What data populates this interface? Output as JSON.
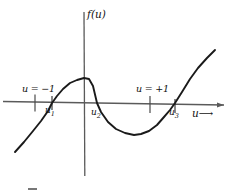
{
  "figure": {
    "kind": "cubic-function-plot",
    "background_color": "#ffffff",
    "ink_color": "#1a1a1a",
    "axis_color": "#555555"
  },
  "axes": {
    "y_axis_label": "f(u)",
    "x_axis_label": "u",
    "x_axis_arrow_glyph": "⟶",
    "x_axis_y_px": 103,
    "y_axis_x_px": 84
  },
  "ticks": [
    {
      "name": "tick-u-minus-1",
      "label": "u = −1",
      "x_px": 35
    },
    {
      "name": "tick-u-plus-1",
      "label": "u = +1",
      "x_px": 150
    }
  ],
  "roots": [
    {
      "name": "root-u1",
      "label": "u",
      "subscript": "1",
      "x_px": 52
    },
    {
      "name": "root-u2",
      "label": "u",
      "subscript": "2",
      "x_px": 97
    },
    {
      "name": "root-u3",
      "label": "u",
      "subscript": "3",
      "x_px": 175
    }
  ],
  "chart_data": {
    "type": "line",
    "title": "",
    "xlabel": "u",
    "ylabel": "f(u)",
    "grid": false,
    "legend": false,
    "series": [
      {
        "name": "f(u)",
        "points_px": [
          [
            15,
            152
          ],
          [
            24,
            142
          ],
          [
            33,
            131
          ],
          [
            41,
            121
          ],
          [
            48,
            111
          ],
          [
            52,
            103
          ],
          [
            57,
            96
          ],
          [
            63,
            89
          ],
          [
            70,
            83
          ],
          [
            77,
            80
          ],
          [
            84,
            78
          ],
          [
            89,
            79
          ],
          [
            93,
            86
          ],
          [
            97,
            103
          ],
          [
            101,
            112
          ],
          [
            108,
            122
          ],
          [
            116,
            129
          ],
          [
            125,
            133
          ],
          [
            134,
            135
          ],
          [
            141,
            134
          ],
          [
            149,
            131
          ],
          [
            157,
            125
          ],
          [
            164,
            117
          ],
          [
            170,
            110
          ],
          [
            175,
            103
          ],
          [
            182,
            92
          ],
          [
            190,
            79
          ],
          [
            198,
            68
          ],
          [
            207,
            58
          ],
          [
            215,
            50
          ]
        ]
      }
    ],
    "features": {
      "local_max_px": [
        86,
        78
      ],
      "local_min_px": [
        136,
        135
      ],
      "roots_px": [
        52,
        103,
        175
      ]
    }
  }
}
